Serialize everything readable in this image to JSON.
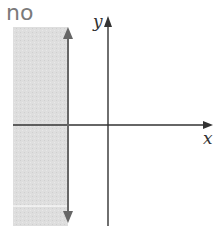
{
  "answer": {
    "text": "no"
  },
  "graph": {
    "x_axis_label": "x",
    "y_axis_label": "y",
    "shaded_region": {
      "description": "x < boundary (left of vertical line)",
      "color": "#dcdcdc"
    },
    "boundary_line": {
      "type": "vertical",
      "style": "solid",
      "color": "#666666",
      "arrows": [
        "up",
        "down"
      ]
    },
    "axis_color": "#333333"
  }
}
